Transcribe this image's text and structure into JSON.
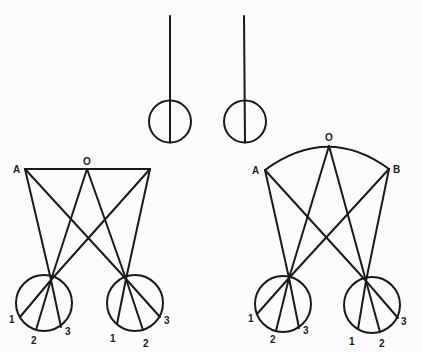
{
  "figure": {
    "background": "#fcfcfc",
    "stroke_color": "#1a1a1a",
    "top_diagram": {
      "description": "Two parallel vertical lines each ending in a circle",
      "eyes": [
        {
          "line_top": [
            170,
            16
          ],
          "center": [
            170,
            121.5
          ],
          "r": 21
        },
        {
          "line_top": [
            244,
            16
          ],
          "center": [
            245,
            121.5
          ],
          "r": 21
        }
      ]
    },
    "left_diagram": {
      "description": "Flat plane A–O with lines converging to two circles",
      "labels": {
        "A": "A",
        "O": "O",
        "p1": "1",
        "p2": "2",
        "p3": "3"
      },
      "A": [
        25,
        169
      ],
      "O": [
        87,
        169
      ],
      "end": [
        150,
        169
      ],
      "circles": [
        {
          "center": [
            44,
            303
          ],
          "r": 28,
          "focal": [
            51,
            280
          ],
          "points": [
            [
              20,
              317
            ],
            [
              36,
              330
            ],
            [
              61,
              327
            ]
          ],
          "labels_pos": [
            [
              11,
              322
            ],
            [
              32,
              343
            ],
            [
              66,
              334
            ]
          ]
        },
        {
          "center": [
            135,
            303
          ],
          "r": 28,
          "focal": [
            126,
            279
          ],
          "points": [
            [
              117,
              324
            ],
            [
              143,
              330
            ],
            [
              160,
              317
            ]
          ],
          "labels_pos": [
            [
              110,
              341
            ],
            [
              144,
              346
            ],
            [
              165,
              323
            ]
          ]
        }
      ]
    },
    "right_diagram": {
      "description": "Curved arc A–O–B with lines converging to two circles",
      "labels": {
        "A": "A",
        "O": "O",
        "B": "B",
        "p1": "1",
        "p2": "2",
        "p3": "3"
      },
      "A": [
        265,
        170
      ],
      "O": [
        329,
        146
      ],
      "B": [
        389,
        169
      ],
      "circles": [
        {
          "center": [
            283,
            304
          ],
          "r": 28,
          "focal": [
            289,
            278
          ],
          "points": [
            [
              257,
              314
            ],
            [
              276,
              331
            ],
            [
              299,
              328
            ]
          ],
          "labels_pos": [
            [
              249,
              322
            ],
            [
              271,
              342
            ],
            [
              304,
              334
            ]
          ]
        },
        {
          "center": [
            372,
            305
          ],
          "r": 28,
          "focal": [
            366,
            281
          ],
          "points": [
            [
              358,
              329
            ],
            [
              380,
              332
            ],
            [
              398,
              318
            ]
          ],
          "labels_pos": [
            [
              349,
              344
            ],
            [
              380,
              346
            ],
            [
              402,
              324
            ]
          ]
        }
      ]
    }
  }
}
